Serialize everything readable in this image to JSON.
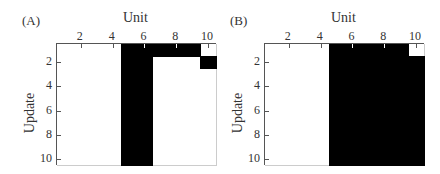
{
  "chart_data": [
    {
      "type": "heatmap",
      "panel_label": "(A)",
      "title": "Unit",
      "xlabel": "Unit",
      "ylabel": "Update",
      "x_ticks": [
        "2",
        "4",
        "6",
        "8",
        "10"
      ],
      "y_ticks": [
        "2",
        "4",
        "6",
        "8",
        "10"
      ],
      "x_range": [
        1,
        10
      ],
      "y_range": [
        1,
        10
      ],
      "colors": {
        "active": "#000000",
        "inactive": "#ffffff"
      },
      "matrix": [
        [
          0,
          0,
          0,
          0,
          1,
          1,
          1,
          1,
          1,
          0
        ],
        [
          0,
          0,
          0,
          0,
          1,
          1,
          0,
          0,
          0,
          1
        ],
        [
          0,
          0,
          0,
          0,
          1,
          1,
          0,
          0,
          0,
          0
        ],
        [
          0,
          0,
          0,
          0,
          1,
          1,
          0,
          0,
          0,
          0
        ],
        [
          0,
          0,
          0,
          0,
          1,
          1,
          0,
          0,
          0,
          0
        ],
        [
          0,
          0,
          0,
          0,
          1,
          1,
          0,
          0,
          0,
          0
        ],
        [
          0,
          0,
          0,
          0,
          1,
          1,
          0,
          0,
          0,
          0
        ],
        [
          0,
          0,
          0,
          0,
          1,
          1,
          0,
          0,
          0,
          0
        ],
        [
          0,
          0,
          0,
          0,
          1,
          1,
          0,
          0,
          0,
          0
        ],
        [
          0,
          0,
          0,
          0,
          1,
          1,
          0,
          0,
          0,
          0
        ]
      ]
    },
    {
      "type": "heatmap",
      "panel_label": "(B)",
      "title": "Unit",
      "xlabel": "Unit",
      "ylabel": "Update",
      "x_ticks": [
        "2",
        "4",
        "6",
        "8",
        "10"
      ],
      "y_ticks": [
        "2",
        "4",
        "6",
        "8",
        "10"
      ],
      "x_range": [
        1,
        10
      ],
      "y_range": [
        1,
        10
      ],
      "colors": {
        "active": "#000000",
        "inactive": "#ffffff"
      },
      "matrix": [
        [
          0,
          0,
          0,
          0,
          1,
          1,
          1,
          1,
          1,
          0
        ],
        [
          0,
          0,
          0,
          0,
          1,
          1,
          1,
          1,
          1,
          1
        ],
        [
          0,
          0,
          0,
          0,
          1,
          1,
          1,
          1,
          1,
          1
        ],
        [
          0,
          0,
          0,
          0,
          1,
          1,
          1,
          1,
          1,
          1
        ],
        [
          0,
          0,
          0,
          0,
          1,
          1,
          1,
          1,
          1,
          1
        ],
        [
          0,
          0,
          0,
          0,
          1,
          1,
          1,
          1,
          1,
          1
        ],
        [
          0,
          0,
          0,
          0,
          1,
          1,
          1,
          1,
          1,
          1
        ],
        [
          0,
          0,
          0,
          0,
          1,
          1,
          1,
          1,
          1,
          1
        ],
        [
          0,
          0,
          0,
          0,
          1,
          1,
          1,
          1,
          1,
          1
        ],
        [
          0,
          0,
          0,
          0,
          1,
          1,
          1,
          1,
          1,
          1
        ]
      ]
    }
  ],
  "panels": [
    {
      "label": "(A)",
      "title": "Unit",
      "ylabel": "Update",
      "xticks": [
        "2",
        "4",
        "6",
        "8",
        "10"
      ],
      "yticks": [
        "2",
        "4",
        "6",
        "8",
        "10"
      ]
    },
    {
      "label": "(B)",
      "title": "Unit",
      "ylabel": "Update",
      "xticks": [
        "2",
        "4",
        "6",
        "8",
        "10"
      ],
      "yticks": [
        "2",
        "4",
        "6",
        "8",
        "10"
      ]
    }
  ]
}
